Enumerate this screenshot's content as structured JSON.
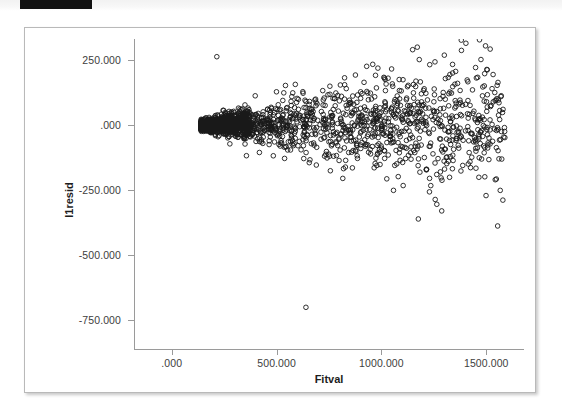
{
  "top_band": {
    "redaction_label": ""
  },
  "chart_data": {
    "type": "scatter",
    "title": "",
    "xlabel": "Fitval",
    "ylabel": "l1resid",
    "xlim": [
      -180,
      1680
    ],
    "ylim": [
      -860,
      330
    ],
    "grid": false,
    "legend": null,
    "marker": {
      "shape": "open-circle",
      "size_px": 4.6,
      "edge_color": "#1a1a1a",
      "fill": "none"
    },
    "xticks": [
      0,
      500,
      1000,
      1500
    ],
    "xticklabels": [
      ".000",
      "500.000",
      "1000.000",
      "1500.000"
    ],
    "yticks": [
      250,
      0,
      -250,
      -500,
      -750
    ],
    "yticklabels": [
      "250.000",
      ".000",
      "-250.000",
      "-500.000",
      "-750.000"
    ],
    "n_points_approx": 1600,
    "notable_points": [
      {
        "x": 640,
        "y": -700,
        "note": "extreme low outlier"
      },
      {
        "x": 1300,
        "y": 268,
        "note": "high outlier right"
      },
      {
        "x": 215,
        "y": 262,
        "note": "high outlier left"
      },
      {
        "x": 1580,
        "y": 60,
        "note": "right-most point"
      },
      {
        "x": 150,
        "y": 0,
        "note": "cone apex"
      }
    ],
    "axis_ranges": {
      "x_min_data": -60,
      "x_max_data": 1590,
      "y_min_data": -700,
      "y_max_data": 270
    }
  }
}
